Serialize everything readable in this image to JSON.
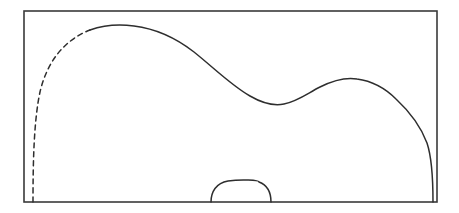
{
  "canvas": {
    "width": 459,
    "height": 213,
    "background_color": "#ffffff"
  },
  "figure": {
    "type": "line-diagram",
    "stroke_color": "#2e2e2e",
    "frame_stroke_color": "#3a3a3a",
    "stroke_width": 1.5,
    "frame_stroke_width": 1.6,
    "dash_pattern": "5 4"
  },
  "frame": {
    "label": "bounding-rectangle",
    "x": 24,
    "y": 11,
    "width": 413,
    "height": 191,
    "left": 24,
    "top": 11,
    "right": 437,
    "bottom": 202,
    "fill": "none"
  },
  "curve_points": {
    "dashed_start": {
      "x": 33,
      "y": 202
    },
    "dashed_end": {
      "x": 90,
      "y": 30
    },
    "first_peak": {
      "x": 132,
      "y": 26
    },
    "valley": {
      "x": 283,
      "y": 104
    },
    "second_peak": {
      "x": 356,
      "y": 79
    },
    "right_descent": {
      "x": 430,
      "y": 150
    },
    "right_end": {
      "x": 433,
      "y": 202
    }
  },
  "notch": {
    "label": "bottom-bump",
    "left_x": 211,
    "right_x": 271,
    "top_y": 180,
    "baseline_y": 202,
    "top_left_x": 228,
    "top_right_x": 262
  },
  "paths": {
    "dashed_segment": "M 33,202 C 33,160 34,120 40,92 C 47,62 64,40 90,30",
    "solid_main": "M 90,30 C 104,25 119,24 134,26 C 158,29 176,38 194,52 C 214,68 232,86 250,96 C 262,103 274,106 284,104 C 298,101 308,93 320,87 C 334,80 345,77 357,79 C 372,81 385,88 396,99 C 410,112 421,127 427,143 C 431,155 433,172 433,202",
    "notch_segment": "M 24,202 L 211,202 C 211,192 216,183 229,181 C 242,179 253,180 259,182 C 267,185 271,192 271,202 L 437,202"
  },
  "chart_data": {
    "type": "line",
    "title": "",
    "xlabel": "",
    "ylabel": "",
    "grid": false,
    "legend": "none",
    "xlim": [
      24,
      437
    ],
    "ylim": [
      202,
      11
    ],
    "series": [
      {
        "name": "dashed-boundary",
        "style": "dashed",
        "x": [
          33,
          34,
          36,
          40,
          47,
          56,
          68,
          80,
          90
        ],
        "y": [
          202,
          170,
          140,
          112,
          82,
          60,
          44,
          35,
          30
        ]
      },
      {
        "name": "solid-boundary",
        "style": "solid",
        "x": [
          90,
          110,
          132,
          155,
          178,
          200,
          225,
          250,
          268,
          283,
          300,
          320,
          340,
          356,
          375,
          395,
          412,
          424,
          430,
          433,
          433
        ],
        "y": [
          30,
          26,
          26,
          29,
          39,
          56,
          76,
          93,
          101,
          104,
          100,
          91,
          82,
          79,
          83,
          95,
          116,
          137,
          158,
          180,
          202
        ]
      },
      {
        "name": "bottom-bump",
        "style": "solid",
        "x": [
          211,
          215,
          222,
          229,
          240,
          252,
          260,
          267,
          271
        ],
        "y": [
          202,
          192,
          184,
          181,
          180,
          180,
          181,
          190,
          202
        ]
      }
    ]
  }
}
